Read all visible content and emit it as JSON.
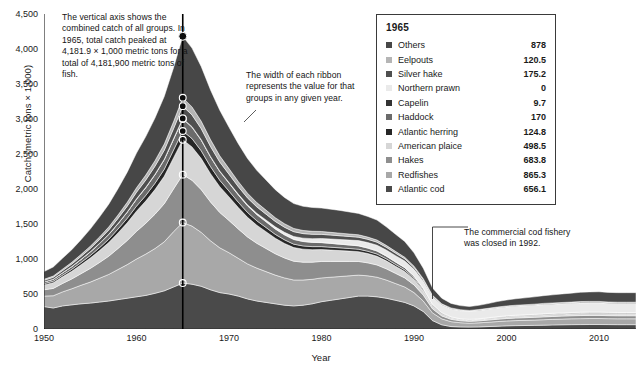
{
  "chart_data": {
    "type": "area",
    "title": "",
    "xlabel": "Year",
    "ylabel": "Catch (metric tons × 1,000)",
    "xlim": [
      1950,
      2014
    ],
    "ylim": [
      0,
      4500
    ],
    "ytick_labels": [
      "0",
      "500",
      "1,000",
      "1,500",
      "2,000",
      "2,500",
      "3,000",
      "3,500",
      "4,000",
      "4,500"
    ],
    "ytick_values": [
      0,
      500,
      1000,
      1500,
      2000,
      2500,
      3000,
      3500,
      4000,
      4500
    ],
    "xtick_labels": [
      "1950",
      "1960",
      "1970",
      "1980",
      "1990",
      "2000",
      "2010"
    ],
    "xtick_values": [
      1950,
      1960,
      1970,
      1980,
      1990,
      2000,
      2010
    ],
    "grid": false,
    "legend_position": "top-right",
    "stack_order_bottom_to_top": [
      "Atlantic cod",
      "Redfishes",
      "Hakes",
      "American plaice",
      "Atlantic herring",
      "Haddock",
      "Capelin",
      "Northern prawn",
      "Silver hake",
      "Eelpouts",
      "Others"
    ],
    "highlight_year": 1965,
    "highlight_total": 4181.9,
    "x": [
      1950,
      1951,
      1952,
      1953,
      1954,
      1955,
      1956,
      1957,
      1958,
      1959,
      1960,
      1961,
      1962,
      1963,
      1964,
      1965,
      1966,
      1967,
      1968,
      1969,
      1970,
      1971,
      1972,
      1973,
      1974,
      1975,
      1976,
      1977,
      1978,
      1979,
      1980,
      1981,
      1982,
      1983,
      1984,
      1985,
      1986,
      1987,
      1988,
      1989,
      1990,
      1991,
      1992,
      1993,
      1994,
      1995,
      1996,
      1997,
      1998,
      1999,
      2000,
      2001,
      2002,
      2003,
      2004,
      2005,
      2006,
      2007,
      2008,
      2009,
      2010,
      2011,
      2012,
      2013,
      2014
    ],
    "series": [
      {
        "name": "Atlantic cod",
        "color": "#4a4a4a",
        "values": [
          320,
          300,
          330,
          345,
          360,
          370,
          385,
          400,
          420,
          440,
          460,
          480,
          510,
          545,
          600,
          656.1,
          640,
          610,
          560,
          520,
          500,
          470,
          430,
          400,
          380,
          360,
          340,
          330,
          340,
          360,
          390,
          410,
          430,
          450,
          470,
          470,
          460,
          440,
          410,
          380,
          330,
          250,
          120,
          60,
          35,
          30,
          28,
          30,
          35,
          40,
          45,
          48,
          50,
          52,
          55,
          58,
          60,
          62,
          63,
          64,
          64,
          63,
          62,
          62,
          62
        ]
      },
      {
        "name": "Redfishes",
        "color": "#a8a8a8",
        "values": [
          150,
          175,
          200,
          230,
          265,
          300,
          340,
          380,
          430,
          480,
          540,
          590,
          640,
          700,
          790,
          865.3,
          830,
          770,
          700,
          640,
          590,
          540,
          500,
          470,
          440,
          410,
          390,
          370,
          360,
          350,
          340,
          330,
          320,
          310,
          300,
          290,
          280,
          260,
          240,
          220,
          190,
          150,
          110,
          85,
          70,
          60,
          55,
          58,
          62,
          66,
          70,
          72,
          74,
          76,
          78,
          80,
          82,
          84,
          85,
          86,
          86,
          85,
          84,
          84,
          84
        ]
      },
      {
        "name": "Hakes",
        "color": "#8e8e8e",
        "values": [
          90,
          105,
          120,
          140,
          165,
          195,
          225,
          260,
          300,
          345,
          395,
          440,
          490,
          545,
          610,
          683.8,
          655,
          610,
          555,
          505,
          460,
          420,
          385,
          355,
          330,
          305,
          285,
          268,
          255,
          245,
          235,
          225,
          215,
          205,
          195,
          185,
          175,
          160,
          145,
          130,
          110,
          85,
          58,
          42,
          33,
          28,
          26,
          28,
          30,
          33,
          35,
          37,
          38,
          39,
          40,
          41,
          42,
          43,
          44,
          44,
          44,
          43,
          43,
          43,
          43
        ]
      },
      {
        "name": "American plaice",
        "color": "#d6d6d6",
        "values": [
          70,
          82,
          95,
          110,
          128,
          148,
          170,
          195,
          222,
          252,
          288,
          318,
          352,
          392,
          444,
          498.5,
          476,
          444,
          404,
          368,
          336,
          306,
          280,
          258,
          240,
          222,
          207,
          195,
          186,
          178,
          170,
          163,
          155,
          148,
          140,
          133,
          125,
          114,
          102,
          92,
          78,
          60,
          40,
          29,
          22,
          18,
          17,
          18,
          20,
          22,
          23,
          24,
          25,
          26,
          27,
          27,
          28,
          28,
          29,
          29,
          29,
          28,
          28,
          28,
          28
        ]
      },
      {
        "name": "Atlantic herring",
        "color": "#262626",
        "values": [
          18,
          21,
          24,
          28,
          32,
          37,
          42,
          48,
          56,
          64,
          72,
          80,
          90,
          100,
          112,
          124.8,
          119,
          111,
          101,
          92,
          84,
          76,
          70,
          64,
          60,
          55,
          52,
          49,
          46,
          44,
          42,
          40,
          39,
          37,
          35,
          33,
          31,
          29,
          26,
          23,
          19,
          15,
          10,
          7,
          6,
          5,
          5,
          5,
          6,
          6,
          7,
          7,
          7,
          7,
          8,
          8,
          8,
          8,
          8,
          8,
          8,
          8,
          8,
          8,
          8
        ]
      },
      {
        "name": "Haddock",
        "color": "#6b6b6b",
        "values": [
          24,
          28,
          33,
          38,
          44,
          50,
          58,
          66,
          76,
          87,
          99,
          110,
          122,
          136,
          152,
          170,
          162,
          151,
          138,
          125,
          114,
          104,
          95,
          88,
          82,
          76,
          71,
          67,
          63,
          60,
          57,
          55,
          52,
          50,
          48,
          45,
          43,
          39,
          35,
          32,
          27,
          21,
          14,
          10,
          8,
          6,
          6,
          6,
          7,
          8,
          8,
          9,
          9,
          9,
          10,
          10,
          10,
          10,
          11,
          11,
          11,
          10,
          10,
          10,
          10
        ]
      },
      {
        "name": "Capelin",
        "color": "#333333",
        "values": [
          1,
          1,
          2,
          2,
          2,
          3,
          3,
          4,
          4,
          5,
          6,
          6,
          7,
          8,
          9,
          9.7,
          9,
          9,
          8,
          7,
          7,
          6,
          6,
          5,
          5,
          5,
          4,
          4,
          4,
          4,
          3,
          3,
          3,
          3,
          3,
          3,
          3,
          2,
          2,
          2,
          2,
          2,
          1,
          1,
          1,
          1,
          1,
          1,
          1,
          1,
          1,
          1,
          1,
          1,
          1,
          1,
          1,
          1,
          1,
          1,
          1,
          1,
          1,
          1,
          1
        ]
      },
      {
        "name": "Northern prawn",
        "color": "#eaeaea",
        "values": [
          0,
          0,
          0,
          0,
          0,
          0,
          0,
          0,
          0,
          0,
          0,
          0,
          0,
          0,
          0,
          0,
          0,
          0,
          0,
          0,
          2,
          5,
          9,
          14,
          20,
          26,
          32,
          38,
          44,
          50,
          56,
          60,
          64,
          68,
          72,
          76,
          80,
          84,
          88,
          92,
          96,
          100,
          104,
          108,
          112,
          116,
          118,
          120,
          122,
          124,
          126,
          127,
          128,
          129,
          130,
          130,
          131,
          131,
          132,
          132,
          132,
          131,
          130,
          130,
          130
        ]
      },
      {
        "name": "Silver hake",
        "color": "#4f4f4f",
        "values": [
          22,
          26,
          30,
          35,
          41,
          47,
          54,
          62,
          72,
          82,
          94,
          104,
          115,
          128,
          144,
          175.2,
          167,
          156,
          142,
          129,
          118,
          107,
          98,
          91,
          84,
          78,
          73,
          69,
          65,
          62,
          59,
          56,
          54,
          51,
          49,
          46,
          44,
          40,
          36,
          32,
          27,
          21,
          14,
          11,
          8,
          7,
          6,
          7,
          7,
          8,
          8,
          9,
          9,
          9,
          10,
          10,
          10,
          10,
          11,
          11,
          11,
          10,
          10,
          10,
          10
        ]
      },
      {
        "name": "Eelpouts",
        "color": "#b5b5b5",
        "values": [
          15,
          18,
          21,
          24,
          28,
          32,
          37,
          43,
          49,
          56,
          64,
          71,
          79,
          88,
          99,
          120.5,
          115,
          107,
          98,
          89,
          81,
          74,
          68,
          62,
          58,
          54,
          50,
          47,
          45,
          43,
          41,
          39,
          37,
          35,
          34,
          32,
          30,
          27,
          25,
          22,
          19,
          15,
          10,
          7,
          6,
          5,
          4,
          5,
          5,
          6,
          6,
          6,
          6,
          7,
          7,
          7,
          7,
          7,
          8,
          8,
          8,
          7,
          7,
          7,
          7
        ]
      },
      {
        "name": "Others",
        "color": "#474747",
        "values": [
          110,
          130,
          155,
          180,
          210,
          245,
          285,
          325,
          375,
          430,
          495,
          550,
          610,
          680,
          770,
          878,
          840,
          780,
          710,
          650,
          590,
          540,
          495,
          460,
          430,
          400,
          375,
          355,
          345,
          340,
          335,
          330,
          325,
          315,
          305,
          295,
          285,
          265,
          245,
          225,
          190,
          150,
          105,
          80,
          65,
          58,
          55,
          60,
          68,
          78,
          85,
          92,
          98,
          104,
          110,
          116,
          122,
          128,
          132,
          136,
          138,
          137,
          136,
          136,
          136
        ]
      }
    ],
    "legend": {
      "year": "1965",
      "entries": [
        {
          "name": "Others",
          "value": "878",
          "color": "#474747"
        },
        {
          "name": "Eelpouts",
          "value": "120.5",
          "color": "#b5b5b5"
        },
        {
          "name": "Silver hake",
          "value": "175.2",
          "color": "#4f4f4f"
        },
        {
          "name": "Northern prawn",
          "value": "0",
          "color": "#eaeaea"
        },
        {
          "name": "Capelin",
          "value": "9.7",
          "color": "#333333"
        },
        {
          "name": "Haddock",
          "value": "170",
          "color": "#6b6b6b"
        },
        {
          "name": "Atlantic herring",
          "value": "124.8",
          "color": "#262626"
        },
        {
          "name": "American plaice",
          "value": "498.5",
          "color": "#d6d6d6"
        },
        {
          "name": "Hakes",
          "value": "683.8",
          "color": "#8e8e8e"
        },
        {
          "name": "Redfishes",
          "value": "865.3",
          "color": "#a8a8a8"
        },
        {
          "name": "Atlantic cod",
          "value": "656.1",
          "color": "#4a4a4a"
        }
      ]
    },
    "annotations": [
      {
        "id": "axis-note",
        "text": "The vertical axis shows the combined catch of all groups. In 1965, total catch peaked at 4,181.9 × 1,000 metric tons for a total of 4,181,900 metric tons of fish."
      },
      {
        "id": "ribbon-note",
        "text": "The width of each ribbon represents the value for that groups in any given year."
      },
      {
        "id": "cod-note",
        "text": "The commercial cod fishery was closed in 1992."
      }
    ]
  }
}
